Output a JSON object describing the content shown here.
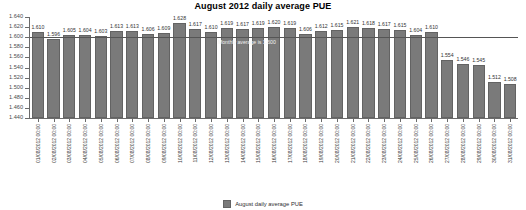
{
  "chart_data": {
    "type": "bar",
    "title": "August 2012 daily average PUE",
    "xlabel": "",
    "ylabel": "",
    "ylim": [
      1.44,
      1.64
    ],
    "ytick_values": [
      1.64,
      1.62,
      1.6,
      1.58,
      1.56,
      1.54,
      1.52,
      1.5,
      1.48,
      1.46,
      1.44
    ],
    "ytick_labels": [
      "1.640",
      "1.620",
      "1.600",
      "1.580",
      "1.560",
      "1.540",
      "1.520",
      "1.500",
      "1.480",
      "1.460",
      "1.440"
    ],
    "grid": false,
    "legend_position": "bottom",
    "legend": [
      "August daily average PUE"
    ],
    "series_name": "August daily average PUE",
    "bar_color": "#7a7a7a",
    "categories": [
      "01/08/2012 00:00",
      "02/08/2012 00:00",
      "03/08/2012 00:00",
      "04/08/2012 00:00",
      "05/08/2012 00:00",
      "06/08/2012 00:00",
      "07/08/2012 00:00",
      "08/08/2012 00:00",
      "09/08/2012 00:00",
      "10/08/2012 00:00",
      "11/08/2012 00:00",
      "12/08/2012 00:00",
      "13/08/2012 00:00",
      "14/08/2012 00:00",
      "15/08/2012 00:00",
      "16/08/2012 00:00",
      "17/08/2012 00:00",
      "18/08/2012 00:00",
      "19/08/2012 00:00",
      "20/08/2012 00:00",
      "21/08/2012 00:00",
      "22/08/2012 00:00",
      "23/08/2012 00:00",
      "24/08/2012 00:00",
      "25/08/2012 00:00",
      "26/08/2012 00:00",
      "27/08/2012 00:00",
      "28/08/2012 00:00",
      "29/08/2012 00:00",
      "30/08/2012 00:00",
      "31/08/2012 00:00"
    ],
    "values": [
      1.61,
      1.596,
      1.605,
      1.604,
      1.603,
      1.613,
      1.613,
      1.606,
      1.609,
      1.628,
      1.617,
      1.61,
      1.619,
      1.617,
      1.619,
      1.62,
      1.619,
      1.606,
      1.612,
      1.615,
      1.621,
      1.618,
      1.617,
      1.615,
      1.604,
      1.61,
      1.554,
      1.546,
      1.545,
      1.512,
      1.508
    ],
    "value_labels": [
      "1.610",
      "1.596",
      "1.605",
      "1.604",
      "1.603",
      "1.613",
      "1.613",
      "1.606",
      "1.609",
      "1.628",
      "1.617",
      "1.610",
      "1.619",
      "1.617",
      "1.619",
      "1.620",
      "1.619",
      "1.606",
      "1.612",
      "1.615",
      "1.621",
      "1.618",
      "1.617",
      "1.615",
      "1.604",
      "1.610",
      "1.554",
      "1.546",
      "1.545",
      "1.512",
      "1.508"
    ],
    "annotations": [
      {
        "name": "monthly-average-line",
        "text": "Monthly average is 1.600",
        "value": 1.6
      }
    ]
  }
}
